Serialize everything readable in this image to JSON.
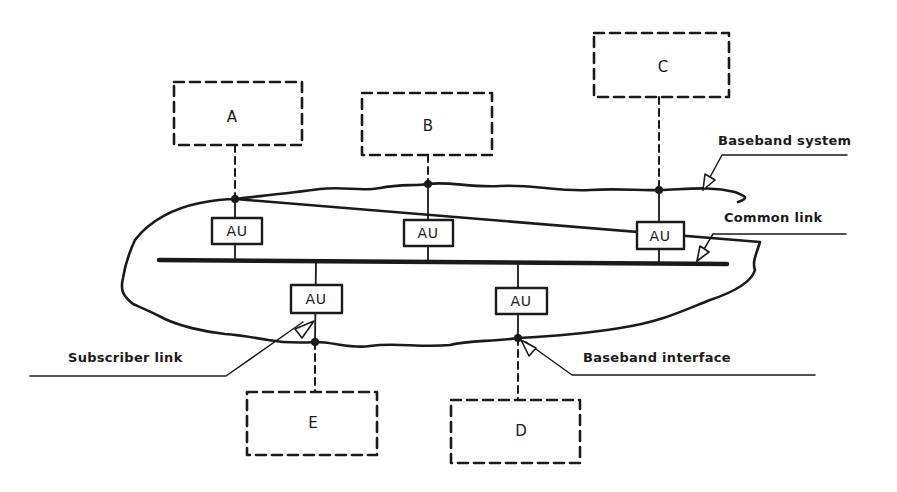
{
  "diagram": {
    "type": "network-topology",
    "nodes": [
      {
        "id": "A",
        "label": "A"
      },
      {
        "id": "B",
        "label": "B"
      },
      {
        "id": "C",
        "label": "C"
      },
      {
        "id": "D",
        "label": "D"
      },
      {
        "id": "E",
        "label": "E"
      }
    ],
    "access_units": [
      {
        "label": "AU",
        "attached_to": "A"
      },
      {
        "label": "AU",
        "attached_to": "B"
      },
      {
        "label": "AU",
        "attached_to": "C"
      },
      {
        "label": "AU",
        "attached_to": "E"
      },
      {
        "label": "AU",
        "attached_to": "D"
      }
    ],
    "callouts": {
      "baseband_system": "Baseband system",
      "common_link": "Common link",
      "subscriber_link": "Subscriber link",
      "baseband_interface": "Baseband interface"
    },
    "colors": {
      "ink": "#1a1a1a",
      "background": "#ffffff"
    }
  }
}
